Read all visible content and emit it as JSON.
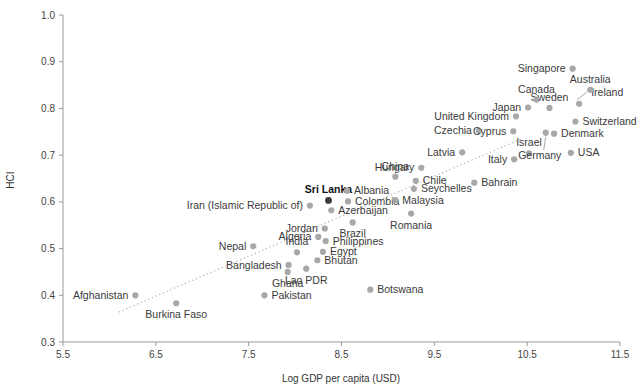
{
  "chart_data": {
    "type": "scatter",
    "title": "",
    "xlabel": "Log GDP per capita (USD)",
    "ylabel": "HCI",
    "xlim": [
      5.5,
      11.5
    ],
    "ylim": [
      0.3,
      1.0
    ],
    "xticks": [
      "5.5",
      "6.5",
      "7.5",
      "8.5",
      "9.5",
      "10.5",
      "11.5"
    ],
    "yticks": [
      "0.3",
      "0.4",
      "0.5",
      "0.6",
      "0.7",
      "0.8",
      "0.9",
      "1.0"
    ],
    "grid": false,
    "legend": "none",
    "highlight": "Sri Lanka",
    "annotations": [
      "Dotted linear trend line rising from lower-left to upper-right"
    ],
    "colors": {
      "point": "#a8a8a8",
      "highlight_point": "#3a3a3a",
      "trendline": "#b9b9b9",
      "axis": "#9a9a9a",
      "text": "#3a3a3a"
    },
    "trendline": {
      "x0": 6.1,
      "y0": 0.364,
      "x1": 10.45,
      "y1": 0.736
    },
    "points": [
      {
        "name": "Afghanistan",
        "x": 6.28,
        "y": 0.4,
        "label_pos": "left"
      },
      {
        "name": "Burkina Faso",
        "x": 6.72,
        "y": 0.383,
        "label_pos": "below"
      },
      {
        "name": "Nepal",
        "x": 7.55,
        "y": 0.505,
        "label_pos": "left"
      },
      {
        "name": "Pakistan",
        "x": 7.67,
        "y": 0.4,
        "label_pos": "right"
      },
      {
        "name": "Bangladesh",
        "x": 7.93,
        "y": 0.465,
        "label_pos": "left"
      },
      {
        "name": "Ghana",
        "x": 7.92,
        "y": 0.45,
        "label_pos": "below"
      },
      {
        "name": "India",
        "x": 8.02,
        "y": 0.492,
        "label_pos": "above"
      },
      {
        "name": "Lao PDR",
        "x": 8.12,
        "y": 0.457,
        "label_pos": "below"
      },
      {
        "name": "Bhutan",
        "x": 8.24,
        "y": 0.475,
        "label_pos": "right"
      },
      {
        "name": "Egypt",
        "x": 8.3,
        "y": 0.493,
        "label_pos": "right"
      },
      {
        "name": "Algeria",
        "x": 8.25,
        "y": 0.525,
        "label_pos": "left"
      },
      {
        "name": "Philippines",
        "x": 8.33,
        "y": 0.516,
        "label_pos": "right"
      },
      {
        "name": "Jordan",
        "x": 8.32,
        "y": 0.543,
        "label_pos": "left"
      },
      {
        "name": "Brazil",
        "x": 8.62,
        "y": 0.556,
        "label_pos": "below"
      },
      {
        "name": "Azerbaijan",
        "x": 8.39,
        "y": 0.582,
        "label_pos": "right"
      },
      {
        "name": "Iran (Islamic Republic of)",
        "x": 8.16,
        "y": 0.592,
        "label_pos": "left"
      },
      {
        "name": "Sri Lanka",
        "x": 8.36,
        "y": 0.603,
        "label_pos": "above",
        "highlight": true
      },
      {
        "name": "Colombia",
        "x": 8.57,
        "y": 0.601,
        "label_pos": "right"
      },
      {
        "name": "Albania",
        "x": 8.56,
        "y": 0.624,
        "label_pos": "right"
      },
      {
        "name": "Malaysia",
        "x": 9.08,
        "y": 0.604,
        "label_pos": "right"
      },
      {
        "name": "Romania",
        "x": 9.25,
        "y": 0.575,
        "label_pos": "below"
      },
      {
        "name": "Seychelles",
        "x": 9.28,
        "y": 0.628,
        "label_pos": "right"
      },
      {
        "name": "Chile",
        "x": 9.3,
        "y": 0.645,
        "label_pos": "right"
      },
      {
        "name": "China",
        "x": 9.08,
        "y": 0.654,
        "label_pos": "above"
      },
      {
        "name": "Hungary",
        "x": 9.36,
        "y": 0.673,
        "label_pos": "left"
      },
      {
        "name": "Bahrain",
        "x": 9.93,
        "y": 0.641,
        "label_pos": "right"
      },
      {
        "name": "Latvia",
        "x": 9.8,
        "y": 0.706,
        "label_pos": "left"
      },
      {
        "name": "Italy",
        "x": 10.36,
        "y": 0.691,
        "label_pos": "left"
      },
      {
        "name": "Israel",
        "x": 10.52,
        "y": 0.704,
        "label_pos": "above"
      },
      {
        "name": "Germany",
        "x": 10.7,
        "y": 0.748,
        "label_pos": "leader-below"
      },
      {
        "name": "USA",
        "x": 10.97,
        "y": 0.705,
        "label_pos": "right"
      },
      {
        "name": "Czechia",
        "x": 9.98,
        "y": 0.752,
        "label_pos": "left"
      },
      {
        "name": "Cyprus",
        "x": 10.35,
        "y": 0.751,
        "label_pos": "left"
      },
      {
        "name": "Denmark",
        "x": 10.79,
        "y": 0.746,
        "label_pos": "right"
      },
      {
        "name": "United Kingdom",
        "x": 10.38,
        "y": 0.783,
        "label_pos": "left"
      },
      {
        "name": "Switzerland",
        "x": 11.02,
        "y": 0.772,
        "label_pos": "right"
      },
      {
        "name": "Japan",
        "x": 10.51,
        "y": 0.802,
        "label_pos": "left"
      },
      {
        "name": "Sweden",
        "x": 10.74,
        "y": 0.801,
        "label_pos": "above"
      },
      {
        "name": "Ireland",
        "x": 11.06,
        "y": 0.81,
        "label_pos": "leader-right"
      },
      {
        "name": "Canada",
        "x": 10.6,
        "y": 0.819,
        "label_pos": "above"
      },
      {
        "name": "Australia",
        "x": 11.18,
        "y": 0.84,
        "label_pos": "above"
      },
      {
        "name": "Singapore",
        "x": 10.99,
        "y": 0.885,
        "label_pos": "left"
      },
      {
        "name": "Botswana",
        "x": 8.81,
        "y": 0.412,
        "label_pos": "right"
      }
    ]
  }
}
